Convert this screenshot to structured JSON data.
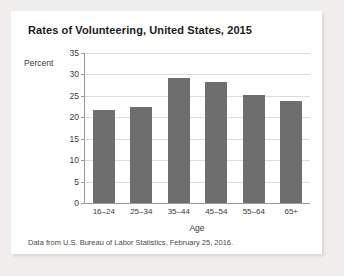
{
  "figure": {
    "source_note": "Data from U.S. Bureau of Labor Statistics, February 25, 2016."
  },
  "colors": {
    "bar_fill": "#6e6e6e",
    "gridline": "#dcdcdc",
    "axis": "#9a9a9a",
    "card_background": "#ffffff",
    "page_background": "#efeeec"
  },
  "chart_data": {
    "type": "bar",
    "title": "Rates of Volunteering, United States, 2015",
    "xlabel": "Age",
    "ylabel": "Percent",
    "categories": [
      "16–24",
      "25–34",
      "35–44",
      "45–54",
      "55–64",
      "65+"
    ],
    "values": [
      21.8,
      22.4,
      29.1,
      28.2,
      25.3,
      23.9
    ],
    "ylim": [
      0,
      35
    ],
    "yticks": [
      0,
      5,
      10,
      15,
      20,
      25,
      30,
      35
    ],
    "ytick_labels": [
      "0",
      "5",
      "10",
      "15",
      "20",
      "25",
      "30",
      "35"
    ],
    "grid": true,
    "legend": false
  }
}
